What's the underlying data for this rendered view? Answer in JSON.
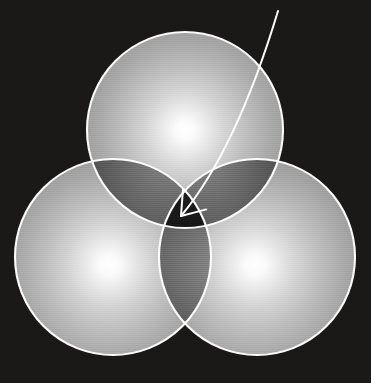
{
  "figure": {
    "title": "Three overlapping translucent spheres with an arrow pointing to the central triple-intersection region",
    "width": 371,
    "height": 383,
    "background_color": "#1a1817",
    "stroke_color": "#ffffff",
    "stroke_width": 2.1
  },
  "chart_data": {
    "type": "diagram",
    "xlabel": "",
    "ylabel": "",
    "xlim": [
      0,
      371
    ],
    "ylim": [
      0,
      383
    ],
    "grid": false,
    "legend": "none",
    "annotations": [
      {
        "name": "pointer-arrow",
        "kind": "curved-arrow",
        "start": [
          278,
          11
        ],
        "end": [
          181,
          216
        ],
        "control": [
          236,
          150
        ],
        "color": "#ffffff",
        "target": "central triple-intersection region"
      }
    ],
    "series": [
      {
        "name": "top-sphere",
        "shape": "circle",
        "cx": 185,
        "cy": 130,
        "r": 98,
        "glow_center": [
          185,
          130
        ],
        "fill": "radial-white-to-gray",
        "label": "A"
      },
      {
        "name": "bottom-left-sphere",
        "shape": "circle",
        "cx": 113,
        "cy": 257,
        "r": 98,
        "glow_center": [
          110,
          265
        ],
        "fill": "radial-white-to-gray",
        "label": "B"
      },
      {
        "name": "bottom-right-sphere",
        "shape": "circle",
        "cx": 257,
        "cy": 257,
        "r": 98,
        "glow_center": [
          255,
          265
        ],
        "fill": "radial-white-to-gray",
        "label": "C"
      }
    ],
    "palette": {
      "background": "#1a1817",
      "sphere_highlight": "#ffffff",
      "sphere_midtone": "#c9c9c9",
      "sphere_edge": "#a8a8a8",
      "pairwise_overlap": "#8e8e8e",
      "triple_overlap": "#6e6e6e",
      "outline": "#ffffff",
      "arrow": "#ffffff"
    }
  }
}
